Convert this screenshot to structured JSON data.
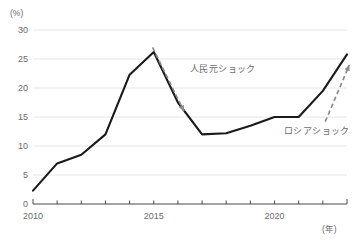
{
  "chart_data": {
    "type": "line",
    "title": "",
    "subtitle": "",
    "xlabel": "(年)",
    "ylabel": "(%)",
    "x": [
      2010,
      2011,
      2012,
      2013,
      2014,
      2015,
      2016,
      2017,
      2018,
      2019,
      2020,
      2021,
      2022,
      2023
    ],
    "series": [
      {
        "name": "",
        "values": [
          2.3,
          7.0,
          8.5,
          12.0,
          22.3,
          26.2,
          17.5,
          12.0,
          12.2,
          13.5,
          15.0,
          15.0,
          19.5,
          25.8
        ],
        "color": "#1a1a1a"
      }
    ],
    "xlim": [
      2010,
      2023
    ],
    "ylim": [
      0,
      30
    ],
    "xticks": [
      2010,
      2011,
      2012,
      2013,
      2014,
      2015,
      2016,
      2017,
      2018,
      2019,
      2020,
      2021,
      2022,
      2023
    ],
    "xtick_labels": [
      "2010",
      "",
      "",
      "",
      "",
      "2015",
      "",
      "",
      "",
      "",
      "2020",
      "",
      "",
      ""
    ],
    "yticks": [
      0,
      5,
      10,
      15,
      20,
      25,
      30
    ],
    "ytick_labels": [
      "0",
      "5",
      "10",
      "15",
      "20",
      "25",
      "30"
    ],
    "grid": true,
    "grid_color": "#e6e6e6",
    "legend": "none",
    "annotations": [
      {
        "text": "人民元ショック",
        "arrow": "down-right",
        "arrow_from_x": 2014.95,
        "arrow_from_y": 27.0,
        "arrow_to_x": 2016.25,
        "arrow_to_y": 16.0,
        "color": "#8c8c8e"
      },
      {
        "text": "ロシアショック",
        "arrow": "up-right",
        "arrow_from_x": 2022.1,
        "arrow_from_y": 14.2,
        "arrow_to_x": 2023.1,
        "arrow_to_y": 24.0,
        "color": "#8c8c8e"
      }
    ]
  },
  "axis": {
    "y_unit": "(%)",
    "x_unit": "(年)"
  },
  "colors": {
    "line": "#1a1a1a",
    "grid": "#e6e6e6",
    "axis": "#4a4a4c",
    "text": "#6a6a6c",
    "annotation": "#8c8c8e",
    "background": "#ffffff"
  }
}
